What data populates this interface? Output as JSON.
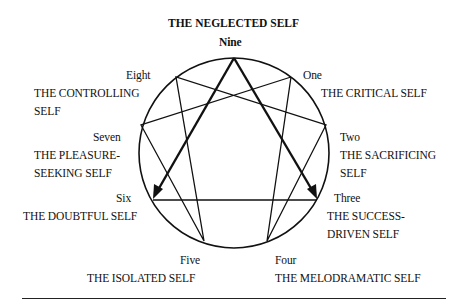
{
  "diagram": {
    "title": "THE NEGLECTED SELF",
    "points": [
      {
        "num": "Nine",
        "name": "THE NEGLECTED SELF"
      },
      {
        "num": "One",
        "name": "THE CRITICAL SELF"
      },
      {
        "num": "Two",
        "name_line1": "THE SACRIFICING",
        "name_line2": "SELF"
      },
      {
        "num": "Three",
        "name_line1": "THE SUCCESS-",
        "name_line2": "DRIVEN SELF"
      },
      {
        "num": "Four",
        "name": "THE MELODRAMATIC SELF"
      },
      {
        "num": "Five",
        "name": "THE ISOLATED SELF"
      },
      {
        "num": "Six",
        "name": "THE DOUBTFUL SELF"
      },
      {
        "num": "Seven",
        "name_line1": "THE PLEASURE-",
        "name_line2": "SEEKING SELF"
      },
      {
        "num": "Eight",
        "name_line1": "THE CONTROLLING",
        "name_line2": "SELF"
      }
    ],
    "arrows": [
      "Nine to Six",
      "Nine to Three"
    ]
  }
}
